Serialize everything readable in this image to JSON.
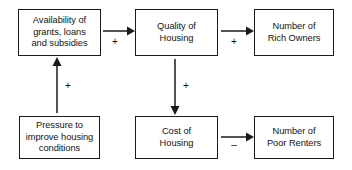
{
  "diagram": {
    "background_color": "#ffffff",
    "line_color": "#1a1a1a",
    "text_color": "#141414",
    "nodes": [
      {
        "id": "availability",
        "label": "Availability of\ngrants, loans\nand subsidies",
        "x": 18,
        "y": 9,
        "w": 83,
        "h": 47
      },
      {
        "id": "quality",
        "label": "Quality of\nHousing",
        "x": 135,
        "y": 9,
        "w": 83,
        "h": 47
      },
      {
        "id": "rich-owners",
        "label": "Number of\nRich Owners",
        "x": 254,
        "y": 9,
        "w": 80,
        "h": 47
      },
      {
        "id": "pressure",
        "label": "Pressure to\nimprove housing\nconditions",
        "x": 19,
        "y": 116,
        "w": 81,
        "h": 43
      },
      {
        "id": "cost",
        "label": "Cost of\nHousing",
        "x": 135,
        "y": 116,
        "w": 83,
        "h": 43
      },
      {
        "id": "poor-renters",
        "label": "Number of\nPoor Renters",
        "x": 254,
        "y": 116,
        "w": 80,
        "h": 43
      }
    ],
    "edges": [
      {
        "id": "availability-to-quality",
        "from": "availability",
        "to": "quality",
        "sign": "+",
        "direction": "right",
        "sign_x": 110,
        "sign_y": 37
      },
      {
        "id": "quality-to-rich-owners",
        "from": "quality",
        "to": "rich-owners",
        "sign": "+",
        "direction": "right",
        "sign_x": 229,
        "sign_y": 37
      },
      {
        "id": "pressure-to-availability",
        "from": "pressure",
        "to": "availability",
        "sign": "+",
        "direction": "up",
        "sign_x": 63,
        "sign_y": 81
      },
      {
        "id": "quality-to-cost",
        "from": "quality",
        "to": "cost",
        "sign": "+",
        "direction": "down",
        "sign_x": 181,
        "sign_y": 81
      },
      {
        "id": "cost-to-poor-renters",
        "from": "cost",
        "to": "poor-renters",
        "sign": "–",
        "direction": "right",
        "sign_x": 229,
        "sign_y": 142
      }
    ]
  }
}
